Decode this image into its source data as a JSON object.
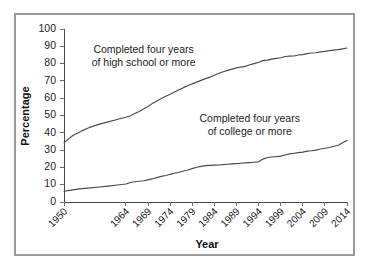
{
  "chart_data": {
    "type": "line",
    "title": "",
    "xlabel": "Year",
    "ylabel": "Percentage",
    "grid": false,
    "legend_position": "inline-annotations",
    "xlim": [
      1950,
      2014
    ],
    "ylim": [
      0,
      100
    ],
    "ytick_labels": [
      "0",
      "10",
      "20",
      "30",
      "40",
      "50",
      "60",
      "70",
      "80",
      "90",
      "100"
    ],
    "yticks": [
      0,
      10,
      20,
      30,
      40,
      50,
      60,
      70,
      80,
      90,
      100
    ],
    "xtick_labels": [
      "1950",
      "1964",
      "1969",
      "1974",
      "1979",
      "1984",
      "1989",
      "1994",
      "1999",
      "2004",
      "2009",
      "2014"
    ],
    "xticks": [
      1950,
      1964,
      1969,
      1974,
      1979,
      1984,
      1989,
      1994,
      1999,
      2004,
      2009,
      2014
    ],
    "annotations": [
      {
        "name": "high-school-annotation",
        "lines": [
          "Completed four years",
          "of high school or more"
        ],
        "x": 1968,
        "y": 86
      },
      {
        "name": "college-annotation",
        "lines": [
          "Completed four years",
          "of college or more"
        ],
        "x": 1992,
        "y": 46
      }
    ],
    "series": [
      {
        "name": "Completed four years of high school or more",
        "color": "#4a4a4a",
        "x": [
          1950,
          1952,
          1954,
          1956,
          1958,
          1960,
          1962,
          1964,
          1965,
          1966,
          1967,
          1968,
          1969,
          1970,
          1971,
          1972,
          1973,
          1974,
          1975,
          1976,
          1977,
          1978,
          1979,
          1980,
          1981,
          1982,
          1983,
          1984,
          1985,
          1986,
          1987,
          1988,
          1989,
          1990,
          1991,
          1992,
          1993,
          1994,
          1995,
          1996,
          1997,
          1998,
          1999,
          2000,
          2001,
          2002,
          2003,
          2004,
          2005,
          2006,
          2007,
          2008,
          2009,
          2010,
          2011,
          2012,
          2013,
          2014
        ],
        "values": [
          34.3,
          38.4,
          41.1,
          43.3,
          45.0,
          46.3,
          47.7,
          49.0,
          49.9,
          51.1,
          52.3,
          53.7,
          55.2,
          57.0,
          58.4,
          59.8,
          61.1,
          62.3,
          63.6,
          64.9,
          66.1,
          67.2,
          68.3,
          69.3,
          70.3,
          71.3,
          72.2,
          73.3,
          74.4,
          75.3,
          76.1,
          76.8,
          77.5,
          78.0,
          78.4,
          79.3,
          80.0,
          80.8,
          81.7,
          82.0,
          82.6,
          83.0,
          83.4,
          84.1,
          84.3,
          84.4,
          85.0,
          85.2,
          85.8,
          86.1,
          86.3,
          86.8,
          87.1,
          87.5,
          87.8,
          88.1,
          88.5,
          89.0
        ]
      },
      {
        "name": "Completed four years of college or more",
        "color": "#4a4a4a",
        "x": [
          1950,
          1952,
          1954,
          1956,
          1958,
          1960,
          1962,
          1964,
          1965,
          1966,
          1967,
          1968,
          1969,
          1970,
          1971,
          1972,
          1973,
          1974,
          1975,
          1976,
          1977,
          1978,
          1979,
          1980,
          1981,
          1982,
          1983,
          1984,
          1985,
          1986,
          1987,
          1988,
          1989,
          1990,
          1991,
          1992,
          1993,
          1994,
          1995,
          1996,
          1997,
          1998,
          1999,
          2000,
          2001,
          2002,
          2003,
          2004,
          2005,
          2006,
          2007,
          2008,
          2009,
          2010,
          2011,
          2012,
          2013,
          2014
        ],
        "values": [
          6.2,
          7.0,
          7.7,
          8.2,
          8.7,
          9.2,
          9.8,
          10.4,
          11.3,
          11.7,
          12.0,
          12.3,
          12.8,
          13.4,
          14.1,
          14.8,
          15.3,
          16.0,
          16.6,
          17.2,
          17.9,
          18.5,
          19.3,
          20.1,
          20.6,
          21.0,
          21.2,
          21.3,
          21.4,
          21.6,
          21.8,
          22.0,
          22.2,
          22.4,
          22.6,
          22.8,
          23.0,
          23.2,
          24.8,
          25.7,
          26.0,
          26.2,
          26.5,
          27.2,
          27.8,
          28.2,
          28.5,
          28.8,
          29.4,
          29.6,
          30.0,
          30.6,
          31.1,
          31.5,
          32.2,
          32.8,
          34.2,
          35.5
        ]
      }
    ]
  },
  "axis": {
    "y_title": "Percentage",
    "x_title": "Year"
  }
}
